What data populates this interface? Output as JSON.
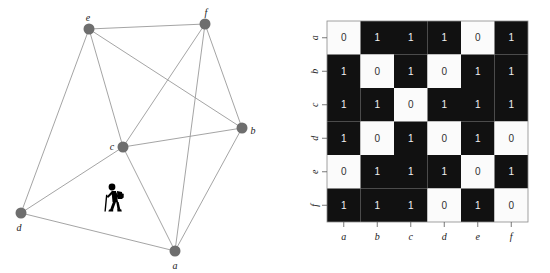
{
  "figure": {
    "title": "",
    "left_panel_name": "undirected-graph",
    "right_panel_name": "adjacency-matrix"
  },
  "graph": {
    "node_color": "#6e6e6e",
    "edge_color": "#9a9a9a",
    "node_radius": 5.5,
    "nodes": [
      {
        "id": "a",
        "label": "a",
        "x": 175,
        "y": 251,
        "label_dx": 0,
        "label_dy": 14
      },
      {
        "id": "b",
        "label": "b",
        "x": 242,
        "y": 128,
        "label_dx": 11,
        "label_dy": 2
      },
      {
        "id": "c",
        "label": "c",
        "x": 123,
        "y": 147,
        "label_dx": -11,
        "label_dy": -1
      },
      {
        "id": "d",
        "label": "d",
        "x": 21,
        "y": 213,
        "label_dx": -2,
        "label_dy": 14
      },
      {
        "id": "e",
        "label": "e",
        "x": 89,
        "y": 29,
        "label_dx": -1,
        "label_dy": -12
      },
      {
        "id": "f",
        "label": "f",
        "x": 205,
        "y": 24,
        "label_dx": 1,
        "label_dy": -12
      }
    ],
    "edges": [
      [
        "a",
        "b"
      ],
      [
        "a",
        "c"
      ],
      [
        "a",
        "d"
      ],
      [
        "a",
        "f"
      ],
      [
        "b",
        "c"
      ],
      [
        "b",
        "e"
      ],
      [
        "b",
        "f"
      ],
      [
        "c",
        "d"
      ],
      [
        "c",
        "e"
      ],
      [
        "c",
        "f"
      ],
      [
        "d",
        "e"
      ],
      [
        "e",
        "f"
      ]
    ],
    "marker": {
      "name": "hiker-icon",
      "glyph": "hiker-with-backpack-and-stick",
      "x": 110,
      "y": 211,
      "color": "#000000"
    }
  },
  "chart_data": {
    "type": "heatmap",
    "title": "",
    "xlabel": "",
    "ylabel": "",
    "categories": [
      "a",
      "b",
      "c",
      "d",
      "e",
      "f"
    ],
    "row_labels": [
      "a",
      "b",
      "c",
      "d",
      "e",
      "f"
    ],
    "col_labels": [
      "a",
      "b",
      "c",
      "d",
      "e",
      "f"
    ],
    "values": [
      [
        0,
        1,
        1,
        1,
        0,
        1
      ],
      [
        1,
        0,
        1,
        0,
        1,
        1
      ],
      [
        1,
        1,
        0,
        1,
        1,
        1
      ],
      [
        1,
        0,
        1,
        0,
        1,
        0
      ],
      [
        0,
        1,
        1,
        1,
        0,
        1
      ],
      [
        1,
        1,
        1,
        0,
        1,
        0
      ]
    ],
    "colorscale": {
      "0": "#fbfbfb",
      "1": "#111111"
    },
    "legend": "none",
    "grid": false,
    "cell_size": 33.5,
    "origin": {
      "x": 27,
      "y": 21
    }
  }
}
